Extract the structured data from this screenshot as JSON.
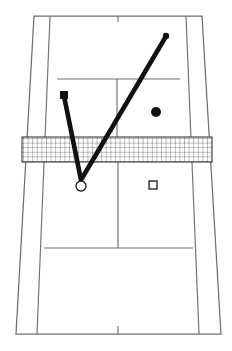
{
  "diagram": {
    "view": "overhead perspective of a tennis court",
    "canvas": {
      "width": 232,
      "height": 351
    },
    "colors": {
      "background": "#ffffff",
      "court_line": "#6f7174",
      "trajectory": "#111111",
      "net": "#1b1b1b",
      "marker_fill": "#111111",
      "marker_open_fill": "#ffffff"
    }
  },
  "court": {
    "name": "tennis-court",
    "orientation": "far court at top, near court at bottom",
    "lines": {
      "far_baseline": {
        "label": "far baseline",
        "y": 16,
        "x1": 34,
        "x2": 202
      },
      "near_baseline": {
        "label": "near baseline",
        "y": 334,
        "x1": 15,
        "x2": 222
      },
      "left_doubles_sideline": {
        "label": "left doubles sideline",
        "x_top": 34,
        "x_bottom": 16
      },
      "left_singles_sideline": {
        "label": "left singles sideline",
        "x_top": 50,
        "x_bottom": 37
      },
      "right_singles_sideline": {
        "label": "right singles sideline",
        "x_top": 186,
        "x_bottom": 199
      },
      "right_doubles_sideline": {
        "label": "right doubles sideline",
        "x_top": 202,
        "x_bottom": 221
      },
      "far_service_line": {
        "label": "far service line",
        "y": 79,
        "x1": 57,
        "x2": 180
      },
      "near_service_line": {
        "label": "near service line",
        "y": 248,
        "x1": 44,
        "x2": 193
      },
      "far_center_service_line": {
        "label": "far center service line",
        "x": 117,
        "y1": 79,
        "y2": 140
      },
      "near_center_service_line": {
        "label": "near center service line",
        "x": 118,
        "y1": 158,
        "y2": 248
      },
      "far_center_mark": {
        "label": "far baseline center mark",
        "x": 118,
        "y1": 16,
        "y2": 22
      },
      "near_center_mark": {
        "label": "near baseline center mark",
        "x": 118,
        "y1": 326,
        "y2": 334
      }
    }
  },
  "net": {
    "name": "tennis-net",
    "label": "net",
    "x": 22,
    "y": 137,
    "width": 190,
    "height": 25,
    "mesh_spacing_px": 4.6
  },
  "trajectory": {
    "name": "ball-trajectory",
    "label": "V-shaped ball trajectory",
    "stroke_width": 4.6,
    "points": [
      {
        "name": "origin-contact-point",
        "x": 64,
        "y": 96,
        "note": "start at filled square player position"
      },
      {
        "name": "bounce-vertex",
        "x": 81,
        "y": 180,
        "note": "bounce point near open circle"
      },
      {
        "name": "end-point",
        "x": 165,
        "y": 38,
        "note": "end at small filled dot in far court"
      }
    ]
  },
  "markers": [
    {
      "name": "marker-filled-square",
      "label": "filled square",
      "shape": "square-filled",
      "x": 64,
      "y": 95,
      "size": 8,
      "court_side": "far court, left service box"
    },
    {
      "name": "marker-filled-circle",
      "label": "filled circle",
      "shape": "circle-filled",
      "x": 156,
      "y": 112,
      "radius": 5,
      "court_side": "far court, right service box"
    },
    {
      "name": "marker-open-circle",
      "label": "open circle",
      "shape": "circle-open",
      "x": 81,
      "y": 186,
      "radius": 5,
      "court_side": "near court, left service box"
    },
    {
      "name": "marker-open-square",
      "label": "open square",
      "shape": "square-open",
      "x": 153,
      "y": 185,
      "size": 8,
      "court_side": "near court, right service box"
    },
    {
      "name": "marker-trajectory-dot",
      "label": "trajectory end dot",
      "shape": "circle-filled",
      "x": 166,
      "y": 36,
      "radius": 3.2,
      "court_side": "far court, upper right"
    }
  ]
}
